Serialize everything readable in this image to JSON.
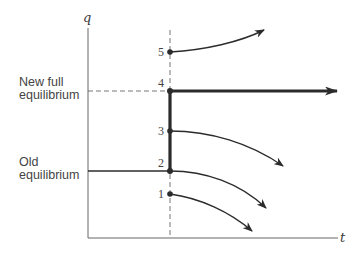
{
  "diagram": {
    "axes": {
      "y_label": "q",
      "x_label": "t"
    },
    "side_labels": {
      "new_equilibrium": [
        "New full",
        "equilibrium"
      ],
      "old_equilibrium": [
        "Old",
        "equilibrium"
      ]
    },
    "points": [
      {
        "id": "1",
        "label": "1",
        "trajectory": "declining"
      },
      {
        "id": "2",
        "label": "2",
        "trajectory": "declining"
      },
      {
        "id": "3",
        "label": "3",
        "trajectory": "declining"
      },
      {
        "id": "4",
        "label": "4",
        "trajectory": "constant"
      },
      {
        "id": "5",
        "label": "5",
        "trajectory": "rising"
      }
    ],
    "colors": {
      "ink": "#2b2b2b",
      "axis": "#555555"
    }
  }
}
